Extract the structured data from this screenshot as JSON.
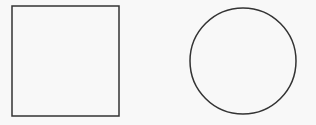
{
  "diagram": {
    "background": "#f8f8f8",
    "stroke_color": "#333333",
    "shapes": [
      {
        "type": "square",
        "x": 12,
        "y": 6,
        "width": 107,
        "height": 110,
        "stroke_width": 1.5
      },
      {
        "type": "circle",
        "cx": 243,
        "cy": 61,
        "r": 53,
        "stroke_width": 1.5
      }
    ]
  }
}
